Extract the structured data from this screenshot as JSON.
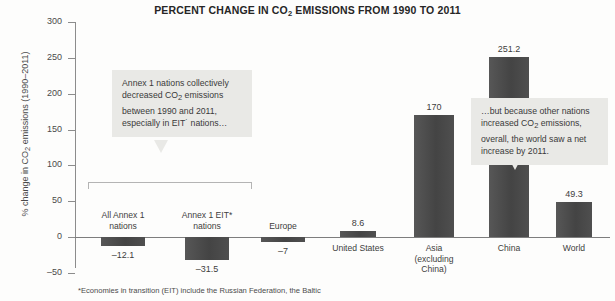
{
  "chart_data": {
    "type": "bar",
    "title": "PERCENT CHANGE IN CO2 EMISSIONS FROM 1990 TO 2011",
    "title_parts": {
      "before": "PERCENT CHANGE IN CO",
      "sub": "2",
      "after": " EMISSIONS FROM 1990 TO 2011"
    },
    "xlabel": "",
    "ylabel": "% change in CO2 emissions (1990–2011)",
    "ylabel_parts": {
      "before": "% change in CO",
      "sub": "2",
      "after": " emissions (1990–2011)"
    },
    "ylim": [
      -50,
      300
    ],
    "yticks": [
      300,
      250,
      200,
      150,
      100,
      50,
      0,
      -50
    ],
    "ytick_labels": [
      "300",
      "250",
      "200",
      "150",
      "100",
      "50",
      "0",
      "–50"
    ],
    "grid": false,
    "legend": "none",
    "bar_color": "#4d4d4d",
    "categories": [
      "All Annex 1 nations",
      "Annex 1 EIT* nations",
      "Europe",
      "United States",
      "Asia (excluding China)",
      "China",
      "World"
    ],
    "category_lines": [
      [
        "All Annex 1",
        "nations"
      ],
      [
        "Annex 1 EIT*",
        "nations"
      ],
      [
        "Europe"
      ],
      [
        "United States"
      ],
      [
        "Asia",
        "(excluding",
        "China)"
      ],
      [
        "China"
      ],
      [
        "World"
      ]
    ],
    "values": [
      -12.1,
      -31.5,
      -7,
      8.6,
      170,
      251.2,
      49.3
    ],
    "value_labels": [
      "–12.1",
      "–31.5",
      "–7",
      "8.6",
      "170",
      "251.2",
      "49.3"
    ]
  },
  "annotations": {
    "bracket_group": "Annex 1 group bracket",
    "callout_left": {
      "line1": "Annex 1 nations collectively",
      "line2_before": "decreased CO",
      "line2_sub": "2",
      "line2_after": " emissions",
      "line3": "between 1990 and 2011,",
      "line4": "especially in EIT˙ nations…"
    },
    "callout_right": {
      "line1": "…but because other nations",
      "line2_before": "increased CO",
      "line2_sub": "2",
      "line2_after": " emissions,",
      "line3": "overall, the world saw a net",
      "line4": "increase by 2011."
    }
  },
  "footnote": {
    "text": "*Economies in transition (EIT) include the Russian Federation, the Baltic"
  }
}
